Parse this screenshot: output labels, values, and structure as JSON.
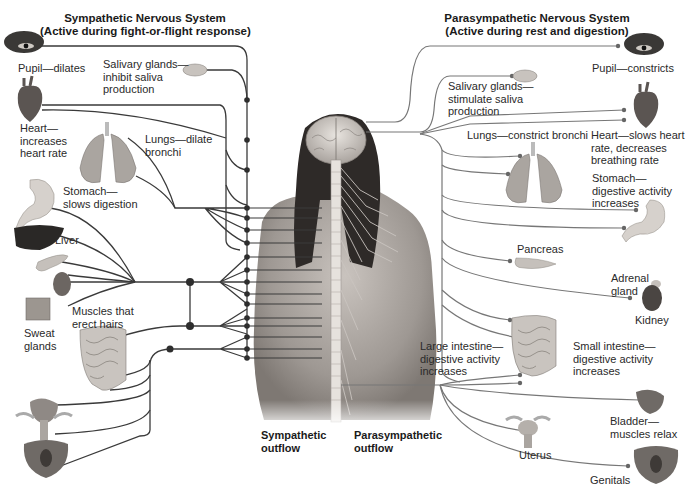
{
  "sympathetic": {
    "title_line1": "Sympathetic Nervous System",
    "title_line2": "(Active during fight-or-flight response)",
    "labels": {
      "pupil": "Pupil—dilates",
      "salivary_1": "Salivary glands—",
      "salivary_2": "inhibit saliva",
      "salivary_3": "production",
      "heart_1": "Heart—",
      "heart_2": "increases",
      "heart_3": "heart rate",
      "lungs_1": "Lungs—dilate",
      "lungs_2": "bronchi",
      "stomach_1": "Stomach—",
      "stomach_2": "slows digestion",
      "liver": "Liver",
      "muscles_1": "Muscles that",
      "muscles_2": "erect hairs",
      "sweat_1": "Sweat",
      "sweat_2": "glands"
    },
    "outflow_1": "Sympathetic",
    "outflow_2": "outflow"
  },
  "parasympathetic": {
    "title_line1": "Parasympathetic Nervous System",
    "title_line2": "(Active during rest and digestion)",
    "labels": {
      "pupil": "Pupil—constricts",
      "salivary_1": "Salivary glands—",
      "salivary_2": "stimulate saliva",
      "salivary_3": "production",
      "lungs": "Lungs—constrict bronchi",
      "heart_1": "Heart—slows heart",
      "heart_2": "rate, decreases",
      "heart_3": "breathing rate",
      "stomach_1": "Stomach—",
      "stomach_2": "digestive activity",
      "stomach_3": "increases",
      "pancreas": "Pancreas",
      "adrenal_1": "Adrenal",
      "adrenal_2": "gland",
      "kidney": "Kidney",
      "large_int_1": "Large intestine—",
      "large_int_2": "digestive activity",
      "large_int_3": "increases",
      "small_int_1": "Small intestine—",
      "small_int_2": "digestive activity",
      "small_int_3": "increases",
      "bladder_1": "Bladder—",
      "bladder_2": "muscles relax",
      "uterus": "Uterus",
      "genitals": "Genitals"
    },
    "outflow_1": "Parasympathetic",
    "outflow_2": "outflow"
  },
  "colors": {
    "sympathetic_nerve": "#3a3a3a",
    "parasympathetic_nerve": "#777777",
    "skin": "#b8b2ad",
    "hair": "#2e2a28",
    "brain": "#d8d4cf"
  }
}
